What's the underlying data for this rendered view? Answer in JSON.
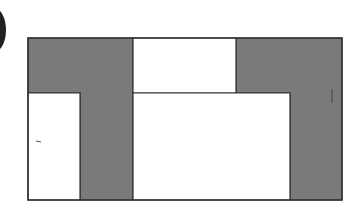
{
  "diagram": {
    "colors": {
      "shaded": "#7a7a7a",
      "unshaded": "#ffffff",
      "stroke": "#333333",
      "marker": "#222222"
    },
    "outer_frame": {
      "x": 28,
      "y": 38,
      "w": 314,
      "h": 162
    },
    "regions": [
      {
        "id": "left-shaded-l",
        "shaded": true,
        "points": "28,38 133,38 133,200 80,200 80,93 28,93"
      },
      {
        "id": "right-shaded-l",
        "shaded": true,
        "points": "236,38 342,38 342,200 290,200 290,93 236,93"
      },
      {
        "id": "top-middle-box",
        "shaded": false,
        "points": "133,38 236,38 236,93 133,93"
      },
      {
        "id": "bottom-left-box",
        "shaded": false,
        "points": "28,93 80,93 80,200 28,200"
      },
      {
        "id": "bottom-middle-box",
        "shaded": false,
        "points": "133,93 290,93 290,200 133,200"
      }
    ]
  }
}
